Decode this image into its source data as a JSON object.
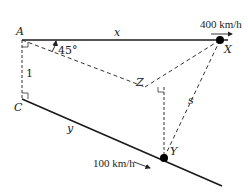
{
  "diagram": {
    "type": "geometry-related-rates",
    "points": {
      "A": {
        "label": "A",
        "x": 22,
        "y": 40
      },
      "C": {
        "label": "C",
        "x": 22,
        "y": 99
      },
      "X": {
        "label": "X",
        "x": 220,
        "y": 40
      },
      "Y": {
        "label": "Y",
        "x": 164,
        "y": 160
      },
      "Z": {
        "label": "Z",
        "x": 145,
        "y": 86
      }
    },
    "labels": {
      "x_segment": "x",
      "y_segment": "y",
      "s_segment": "s",
      "height": "1",
      "angle": "45°",
      "speed_x": "400 km/h",
      "speed_y": "100 km/h"
    },
    "colors": {
      "line": "#1a1a1a",
      "dashed": "#333333",
      "point": "#000000"
    }
  }
}
